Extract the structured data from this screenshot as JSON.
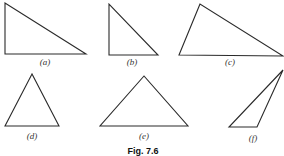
{
  "figure": {
    "caption": "Fig. 7.6",
    "stroke_color": "#2a2a2a",
    "triangles": [
      {
        "id": "a",
        "label": "(a)",
        "points": "5,3 5,54 86,54",
        "label_x": 45,
        "label_y": 65
      },
      {
        "id": "b",
        "label": "(b)",
        "points": "109,4 109,55 158,55",
        "label_x": 132,
        "label_y": 65
      },
      {
        "id": "c",
        "label": "(c)",
        "points": "200,4 179,55 283,56",
        "label_x": 230,
        "label_y": 65
      },
      {
        "id": "d",
        "label": "(d)",
        "points": "32,74 5,126 59,126",
        "label_x": 32,
        "label_y": 139
      },
      {
        "id": "e",
        "label": "(e)",
        "points": "144,76 100,126 188,126",
        "label_x": 144,
        "label_y": 139
      },
      {
        "id": "f",
        "label": "(f)",
        "points": "283,70 229,127 257,127",
        "label_x": 253,
        "label_y": 141
      }
    ]
  }
}
